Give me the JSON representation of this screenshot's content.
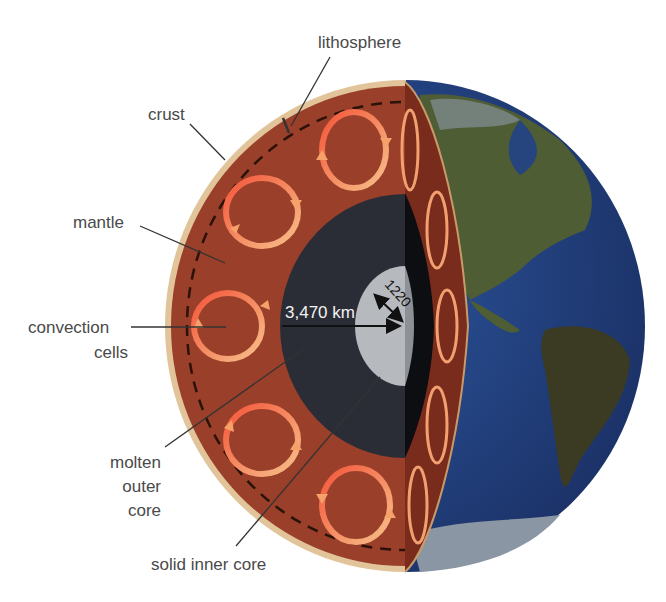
{
  "labels": {
    "lithosphere": "lithosphere",
    "crust": "crust",
    "mantle": "mantle",
    "convection_1": "convection",
    "convection_2": "cells",
    "molten_1": "molten",
    "molten_2": "outer",
    "molten_3": "core",
    "solid_inner_core": "solid inner core"
  },
  "measurements": {
    "outer_core_radius": "3,470 km",
    "inner_core_radius": "1220"
  },
  "colors": {
    "crust": "#e2c49a",
    "mantle": "#9a3f2a",
    "mantle_side": "#7a2c1c",
    "outer_core": "#2a2d36",
    "inner_core": "#b6b9be",
    "ocean": "#22407a",
    "land": "#4f5b33",
    "convection": "#f4653a",
    "convection_light": "#f6b07a",
    "label_text": "#4a4a4a",
    "leader_line": "#333333"
  }
}
